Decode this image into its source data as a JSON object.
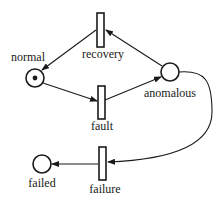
{
  "diagram": {
    "type": "petri-net",
    "places": [
      {
        "id": "normal",
        "label": "normal",
        "tokens": 1
      },
      {
        "id": "anomalous",
        "label": "anomalous",
        "tokens": 0
      },
      {
        "id": "failed",
        "label": "failed",
        "tokens": 0
      }
    ],
    "transitions": [
      {
        "id": "recovery",
        "label": "recovery"
      },
      {
        "id": "fault",
        "label": "fault"
      },
      {
        "id": "failure",
        "label": "failure"
      }
    ],
    "arcs": [
      {
        "from": "normal",
        "to": "fault"
      },
      {
        "from": "fault",
        "to": "anomalous"
      },
      {
        "from": "anomalous",
        "to": "recovery"
      },
      {
        "from": "recovery",
        "to": "normal"
      },
      {
        "from": "anomalous",
        "to": "failure"
      },
      {
        "from": "failure",
        "to": "failed"
      }
    ],
    "colors": {
      "stroke": "#1a1a1a",
      "background": "#ffffff"
    }
  }
}
